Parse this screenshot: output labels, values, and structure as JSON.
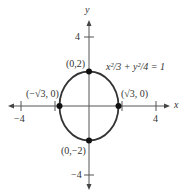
{
  "diagram": {
    "equation": "x²/3 + y²/4 = 1",
    "axes": {
      "x_label": "x",
      "y_label": "y",
      "x_ticks": [
        {
          "value": -4,
          "label": "−4"
        },
        {
          "value": 4,
          "label": "4"
        }
      ],
      "y_ticks": [
        {
          "value": 4,
          "label": "4"
        },
        {
          "value": -4,
          "label": "−4"
        }
      ]
    },
    "points": [
      {
        "label": "(0,2)",
        "x": 0,
        "y": 2
      },
      {
        "label": "(0,−2)",
        "x": 0,
        "y": -2
      },
      {
        "label": "(−√3, 0)",
        "x": -1.732,
        "y": 0
      },
      {
        "label": "(√3, 0)",
        "x": 1.732,
        "y": 0
      }
    ],
    "colors": {
      "curve": "#333333",
      "axis": "#555555",
      "point": "#111111"
    }
  }
}
